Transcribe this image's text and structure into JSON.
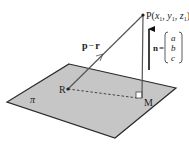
{
  "diagram": {
    "colors": {
      "plane_fill": "#c6c6c6",
      "stroke": "#2a2a2a",
      "line": "#555555",
      "background": "#ffffff"
    },
    "plane": {
      "label": "π",
      "corners": [
        [
          69,
          64
        ],
        [
          176,
          88
        ],
        [
          115,
          138
        ],
        [
          7,
          102
        ]
      ]
    },
    "points": {
      "P": {
        "label_prefix": "P(",
        "x": "x",
        "y": "y",
        "z": "z",
        "sub": "1",
        "coords": [
          143,
          15
        ]
      },
      "R": {
        "label": "R",
        "coords": [
          68,
          89
        ]
      },
      "M": {
        "label": "M",
        "coords": [
          142,
          98
        ]
      }
    },
    "vectors": {
      "pr": {
        "label_p": "p",
        "minus": "−",
        "label_r": "r",
        "from": "R",
        "to": "P"
      },
      "normal": {
        "label": "n",
        "equals": "=",
        "components": [
          "a",
          "b",
          "c"
        ]
      }
    },
    "segments": {
      "RM": {
        "style": "dashed"
      },
      "PM": {
        "style": "solid",
        "right_angle_at": "M"
      }
    }
  }
}
